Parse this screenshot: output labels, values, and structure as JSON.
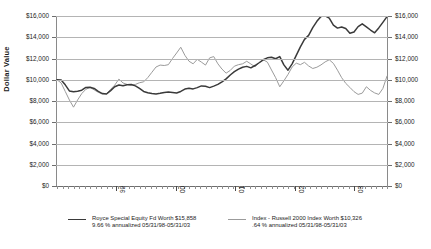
{
  "chart_data": {
    "type": "line",
    "title": "",
    "xlabel": "",
    "ylabel": "Dollar Value",
    "ylim": [
      0,
      16000
    ],
    "ytick_labels": [
      "$16,000",
      "$14,000",
      "$12,000",
      "$10,000",
      "$8,000",
      "$6,000",
      "$4,000",
      "$2,000",
      "$0"
    ],
    "ytick_values": [
      16000,
      14000,
      12000,
      10000,
      8000,
      6000,
      4000,
      2000,
      0
    ],
    "xtick_labels": [
      "99",
      "00",
      "01",
      "02",
      "03"
    ],
    "grid": true,
    "dual_axis": true,
    "legend_position": "bottom",
    "x_range_label": "05/31/98-05/31/03",
    "series": [
      {
        "name": "Royce Special Equity Fd",
        "color": "#3a3a3a",
        "final_value": 15858,
        "values": [
          10000,
          9980,
          9520,
          8950,
          8880,
          8920,
          9020,
          9280,
          9300,
          9180,
          8900,
          8700,
          8660,
          8980,
          9340,
          9500,
          9430,
          9520,
          9560,
          9420,
          9180,
          8900,
          8780,
          8700,
          8660,
          8720,
          8800,
          8840,
          8800,
          8760,
          8900,
          9120,
          9200,
          9140,
          9260,
          9420,
          9380,
          9260,
          9400,
          9560,
          9800,
          10080,
          10450,
          10760,
          11000,
          11180,
          11260,
          11120,
          11340,
          11600,
          11880,
          12060,
          12120,
          11980,
          12180,
          11400,
          10900,
          11500,
          12300,
          13100,
          13800,
          14180,
          14900,
          15500,
          15960,
          16020,
          15800,
          15140,
          14860,
          14960,
          14820,
          14380,
          14500,
          15000,
          15260,
          14980,
          14680,
          14420,
          14880,
          15400,
          15940
        ]
      },
      {
        "name": "Index - Russell 2000 Index",
        "color": "#9b9b9b",
        "final_value": 10326,
        "values": [
          10000,
          9700,
          8900,
          8100,
          7420,
          8100,
          8700,
          9100,
          9280,
          9050,
          8820,
          8650,
          8700,
          9100,
          9500,
          10060,
          9700,
          9560,
          9480,
          9560,
          9720,
          9800,
          10200,
          10700,
          11200,
          11380,
          11340,
          11420,
          12000,
          12520,
          13060,
          12300,
          11740,
          11500,
          11920,
          11660,
          11380,
          12060,
          12180,
          11500,
          11000,
          10620,
          10880,
          11280,
          11420,
          11500,
          11740,
          11480,
          11220,
          11600,
          11880,
          11660,
          10920,
          10200,
          9340,
          9900,
          10500,
          11200,
          11560,
          11420,
          11640,
          11300,
          11060,
          11180,
          11400,
          11680,
          11880,
          11540,
          10900,
          10200,
          9660,
          9280,
          8880,
          8620,
          8740,
          9340,
          9000,
          8760,
          8620,
          9180,
          10340
        ]
      }
    ]
  },
  "legend": {
    "entries": [
      {
        "line1": "Royce Special Equity Fd Worth $15,858",
        "line2": "9.66 % annualized 05/31/98-05/31/03"
      },
      {
        "line1": "Index - Russell 2000 Index Worth $10,326",
        "line2": ".64 % annualized 05/31/98-05/31/03"
      }
    ]
  }
}
